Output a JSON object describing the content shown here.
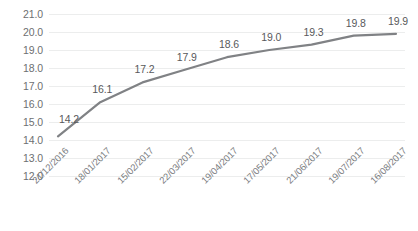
{
  "chart_data": {
    "type": "line",
    "title": "",
    "subtitle": "",
    "xlabel": "",
    "ylabel": "",
    "categories": [
      "21/12/2016",
      "18/01/2017",
      "15/02/2017",
      "22/03/2017",
      "19/04/2017",
      "17/05/2017",
      "21/06/2017",
      "19/07/2017",
      "16/08/2017"
    ],
    "values": [
      14.2,
      16.1,
      17.2,
      17.9,
      18.6,
      19.0,
      19.3,
      19.8,
      19.9
    ],
    "point_labels": [
      "14.2",
      "16.1",
      "17.2",
      "17.9",
      "18.6",
      "19.0",
      "19.3",
      "19.8",
      "19.9"
    ],
    "ylim": [
      12.0,
      21.0
    ],
    "ytick_values": [
      12.0,
      13.0,
      14.0,
      15.0,
      16.0,
      17.0,
      18.0,
      19.0,
      20.0,
      21.0
    ],
    "ytick_labels": [
      "12.0",
      "13.0",
      "14.0",
      "15.0",
      "16.0",
      "17.0",
      "18.0",
      "19.0",
      "20.0",
      "21.0"
    ],
    "ytick_step": 1.0,
    "grid": {
      "horizontal": true,
      "vertical": false,
      "color": "#ECEDED"
    },
    "legend": {
      "visible": false,
      "position": "none",
      "entries": []
    },
    "series": [
      {
        "name": "Series 1",
        "color": "#808285",
        "line_width": 2.2,
        "markers": false,
        "values": [
          14.2,
          16.1,
          17.2,
          17.9,
          18.6,
          19.0,
          19.3,
          19.8,
          19.9
        ]
      }
    ],
    "data_label_color": "#58595B",
    "axis_label_color": "#6D6F71",
    "background_color": "#FFFFFF",
    "x_label_rotation_deg": -45
  }
}
